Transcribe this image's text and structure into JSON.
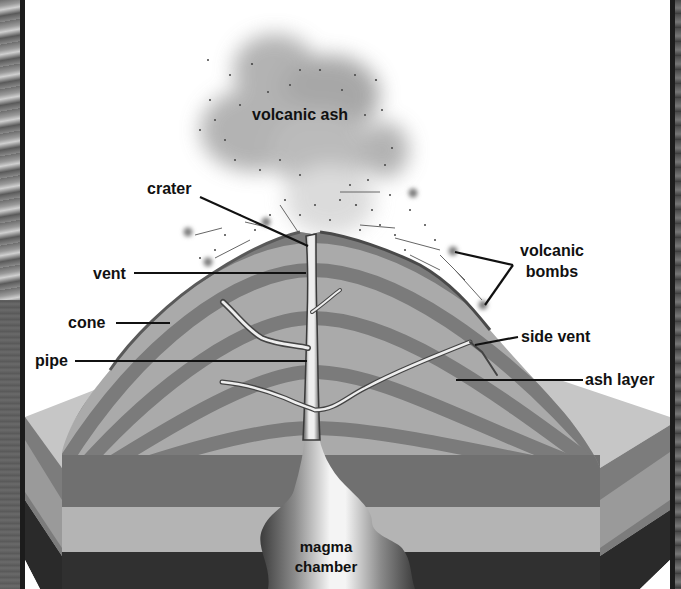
{
  "diagram": {
    "labels": {
      "volcanic_ash": "volcanic ash",
      "crater": "crater",
      "vent": "vent",
      "cone": "cone",
      "pipe": "pipe",
      "volcanic_bombs_line1": "volcanic",
      "volcanic_bombs_line2": "bombs",
      "side_vent": "side vent",
      "ash_layer": "ash layer",
      "magma_chamber_line1": "magma",
      "magma_chamber_line2": "chamber"
    },
    "colors": {
      "background": "#ffffff",
      "frame_border": "#1c1c1c",
      "ash_cloud": "#8c8c8c",
      "cone_light": "#a9a9a9",
      "cone_dark": "#7a7a7a",
      "ground_top": "#c8c8c8",
      "rock_dark": "#707070",
      "rock_light": "#b4b4b4",
      "bedrock": "#3a3a3a",
      "magma_light": "#f2f2f2",
      "magma_dark": "#4a4a4a",
      "label_text": "#111111"
    }
  }
}
